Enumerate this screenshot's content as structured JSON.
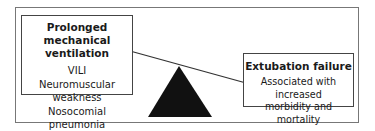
{
  "diagram": {
    "type": "balance-scale",
    "left_box": {
      "title": "Prolonged mechanical ventilation",
      "title_line1": "Prolonged mechanical",
      "title_line2": "ventilation",
      "items": [
        "VILI",
        "Neuromuscular weakness",
        "Nosocomial pneumonia"
      ]
    },
    "right_box": {
      "title": "Extubation failure",
      "description_line1": "Associated with increased",
      "description_line2": "morbidity and mortality"
    },
    "colors": {
      "fulcrum": "#111111",
      "beam": "#333333",
      "frame": "#777777",
      "background": "#ffffff"
    }
  }
}
